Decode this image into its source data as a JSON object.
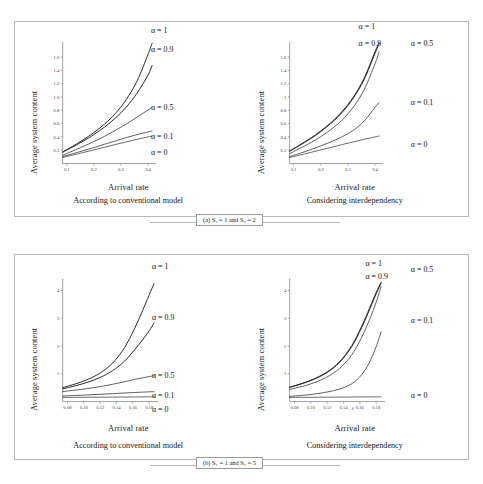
{
  "figure": {
    "panel_a_tag": "(a) S₁ = 1 and S₂ = 2",
    "panel_b_tag": "(b) S₁ = 1 and S₂ = 5",
    "axis_y_title": "Average system content",
    "axis_x_title": "Arrival rate",
    "caption_conventional": "According to conventional model",
    "caption_interdependency": "Considering interdependency",
    "lambda_symbol": "λ"
  },
  "chart_data": [
    {
      "id": "a-left",
      "type": "line",
      "title": "According to conventional model",
      "panel": "(a) S1 = 1 and S2 = 2",
      "xlabel": "Arrival rate",
      "ylabel": "Average system content",
      "xlim": [
        0.085,
        0.415
      ],
      "ylim": [
        0.0,
        1.8
      ],
      "xticks": [
        "0.1",
        "0.2",
        "0.3",
        "0.4"
      ],
      "xtickvals": [
        0.1,
        0.2,
        0.3,
        0.4
      ],
      "yticks": [
        "0.2",
        "0.4",
        "0.6",
        "0.8",
        "1.0",
        "1.2",
        "1.4",
        "1.6"
      ],
      "ytickvals": [
        0.2,
        0.4,
        0.6,
        0.8,
        1.0,
        1.2,
        1.4,
        1.6
      ],
      "grid": false,
      "legend_position": "right-inline",
      "x": [
        0.085,
        0.12,
        0.16,
        0.2,
        0.24,
        0.28,
        0.32,
        0.36,
        0.4,
        0.415
      ],
      "series": [
        {
          "name": "α = 1",
          "label": "α = 1",
          "values": [
            0.175,
            0.255,
            0.355,
            0.465,
            0.595,
            0.755,
            0.965,
            1.245,
            1.64,
            1.81
          ]
        },
        {
          "name": "α = 0.9",
          "label": "α = 0.9",
          "values": [
            0.17,
            0.245,
            0.335,
            0.435,
            0.55,
            0.685,
            0.85,
            1.06,
            1.33,
            1.475
          ]
        },
        {
          "name": "α = 0.5",
          "label": "α = 0.5",
          "values": [
            0.125,
            0.185,
            0.255,
            0.33,
            0.41,
            0.5,
            0.595,
            0.7,
            0.805,
            0.85
          ]
        },
        {
          "name": "α = 0.1",
          "label": "α = 0.1",
          "values": [
            0.105,
            0.145,
            0.192,
            0.24,
            0.29,
            0.34,
            0.39,
            0.435,
            0.475,
            0.49
          ]
        },
        {
          "name": "α = 0",
          "label": "α = 0",
          "values": [
            0.092,
            0.125,
            0.165,
            0.205,
            0.245,
            0.287,
            0.325,
            0.365,
            0.4,
            0.412
          ]
        }
      ]
    },
    {
      "id": "a-right",
      "type": "line",
      "title": "Considering interdependency",
      "panel": "(a) S1 = 1 and S2 = 2",
      "xlabel": "Arrival rate",
      "ylabel": "Average system content",
      "xlim": [
        0.085,
        0.415
      ],
      "ylim": [
        0.0,
        1.8
      ],
      "xticks": [
        "0.1",
        "0.2",
        "0.3",
        "0.4"
      ],
      "xtickvals": [
        0.1,
        0.2,
        0.3,
        0.4
      ],
      "yticks": [
        "0.2",
        "0.4",
        "0.6",
        "0.8",
        "1",
        "1.2",
        "1.4",
        "1.6"
      ],
      "ytickvals": [
        0.2,
        0.4,
        0.6,
        0.8,
        1.0,
        1.2,
        1.4,
        1.6
      ],
      "grid": false,
      "legend_position": "right-inline",
      "x": [
        0.085,
        0.12,
        0.16,
        0.2,
        0.24,
        0.28,
        0.32,
        0.36,
        0.4,
        0.415
      ],
      "series": [
        {
          "name": "α = 1",
          "label": "α = 1",
          "values": [
            0.19,
            0.275,
            0.375,
            0.49,
            0.625,
            0.79,
            1.0,
            1.285,
            1.68,
            1.82
          ]
        },
        {
          "name": "α = 0.9",
          "label": "α = 0.9",
          "values": [
            0.185,
            0.268,
            0.367,
            0.48,
            0.613,
            0.775,
            0.985,
            1.265,
            1.655,
            1.8
          ]
        },
        {
          "name": "α = 0.5",
          "label": "α = 0.5",
          "values": [
            0.15,
            0.222,
            0.308,
            0.405,
            0.52,
            0.66,
            0.85,
            1.11,
            1.5,
            1.68
          ]
        },
        {
          "name": "α = 0.1",
          "label": "α = 0.1",
          "values": [
            0.105,
            0.15,
            0.205,
            0.265,
            0.33,
            0.405,
            0.5,
            0.64,
            0.845,
            0.915
          ]
        },
        {
          "name": "α = 0",
          "label": "α = 0",
          "values": [
            0.092,
            0.125,
            0.165,
            0.205,
            0.245,
            0.287,
            0.325,
            0.365,
            0.4,
            0.412
          ]
        }
      ]
    },
    {
      "id": "b-left",
      "type": "line",
      "title": "According to conventional model",
      "panel": "(b) S1 = 1 and S2 = 5",
      "xlabel": "Arrival rate",
      "ylabel": "Average system content",
      "xlim": [
        0.074,
        0.186
      ],
      "ylim": [
        0.0,
        4.35
      ],
      "xticks": [
        "0.08",
        "0.10",
        "0.12",
        "0.14",
        "0.16",
        "0.18"
      ],
      "xtickvals": [
        0.08,
        0.1,
        0.12,
        0.14,
        0.16,
        0.18
      ],
      "yticks": [
        "1",
        "2",
        "3",
        "4"
      ],
      "ytickvals": [
        1,
        2,
        3,
        4
      ],
      "grid": false,
      "legend_position": "right-inline",
      "x": [
        0.074,
        0.09,
        0.105,
        0.12,
        0.135,
        0.15,
        0.162,
        0.172,
        0.18,
        0.186
      ],
      "series": [
        {
          "name": "α = 1",
          "label": "α = 1",
          "values": [
            0.5,
            0.64,
            0.8,
            1.03,
            1.38,
            1.95,
            2.62,
            3.28,
            3.84,
            4.25
          ]
        },
        {
          "name": "α = 0.9",
          "label": "α = 0.9",
          "values": [
            0.455,
            0.57,
            0.7,
            0.87,
            1.11,
            1.46,
            1.86,
            2.23,
            2.55,
            2.83
          ]
        },
        {
          "name": "α = 0.5",
          "label": "α = 0.5",
          "values": [
            0.36,
            0.415,
            0.47,
            0.54,
            0.62,
            0.715,
            0.795,
            0.855,
            0.9,
            0.93
          ]
        },
        {
          "name": "α = 0.1",
          "label": "α = 0.1",
          "values": [
            0.2,
            0.22,
            0.24,
            0.262,
            0.285,
            0.308,
            0.326,
            0.34,
            0.35,
            0.357
          ]
        },
        {
          "name": "α = 0",
          "label": "α = 0",
          "values": [
            0.15,
            0.152,
            0.155,
            0.158,
            0.161,
            0.164,
            0.166,
            0.168,
            0.17,
            0.171
          ]
        }
      ]
    },
    {
      "id": "b-right",
      "type": "line",
      "title": "Considering interdependency",
      "panel": "(b) S1 = 1 and S2 = 5",
      "xlabel": "Arrival rate",
      "ylabel": "Average system content",
      "xlim": [
        0.074,
        0.186
      ],
      "ylim": [
        0.0,
        4.35
      ],
      "xticks": [
        "0.08",
        "0.10",
        "0.12",
        "0.14",
        "0.16",
        "0.18"
      ],
      "xtickvals": [
        0.08,
        0.1,
        0.12,
        0.14,
        0.16,
        0.18
      ],
      "yticks": [
        "1",
        "2",
        "3",
        "4"
      ],
      "ytickvals": [
        1,
        2,
        3,
        4
      ],
      "grid": false,
      "legend_position": "right-inline",
      "x_axis_symbol": "λ",
      "x": [
        0.074,
        0.09,
        0.105,
        0.12,
        0.135,
        0.15,
        0.162,
        0.172,
        0.18,
        0.186
      ],
      "series": [
        {
          "name": "α = 1",
          "label": "α = 1",
          "values": [
            0.52,
            0.66,
            0.83,
            1.07,
            1.43,
            2.01,
            2.7,
            3.37,
            3.93,
            4.3
          ]
        },
        {
          "name": "α = 0.9",
          "label": "α = 0.9",
          "values": [
            0.515,
            0.65,
            0.818,
            1.05,
            1.405,
            1.975,
            2.655,
            3.32,
            3.88,
            4.26
          ]
        },
        {
          "name": "α = 0.5",
          "label": "α = 0.5",
          "values": [
            0.44,
            0.55,
            0.69,
            0.89,
            1.19,
            1.68,
            2.3,
            2.96,
            3.58,
            4.14
          ]
        },
        {
          "name": "α = 0.1",
          "label": "α = 0.1",
          "values": [
            0.185,
            0.225,
            0.275,
            0.345,
            0.45,
            0.64,
            0.96,
            1.42,
            1.98,
            2.51
          ]
        },
        {
          "name": "α = 0",
          "label": "α = 0",
          "values": [
            0.15,
            0.152,
            0.155,
            0.158,
            0.161,
            0.164,
            0.166,
            0.168,
            0.17,
            0.171
          ]
        }
      ]
    }
  ],
  "annotations": {
    "a_left": [
      {
        "label": "α = 1",
        "x": 0.6,
        "y": 0.055
      },
      {
        "label": "α = 0.9",
        "x": 0.6,
        "y": 0.155
      },
      {
        "label": "α = 0.5",
        "x": 0.6,
        "y": 0.455
      },
      {
        "label": "α = 0.1",
        "x": 0.6,
        "y": 0.605
      },
      {
        "label": "α = 0",
        "x": 0.6,
        "y": 0.685
      }
    ],
    "a_right": [
      {
        "label": "α = 1",
        "x": 0.515,
        "y": 0.035
      },
      {
        "label": "α = 0.9",
        "x": 0.515,
        "y": 0.125
      },
      {
        "label": "α = 0.5",
        "x": 0.745,
        "y": 0.125
      },
      {
        "label": "α = 0.1",
        "x": 0.745,
        "y": 0.43
      },
      {
        "label": "α = 0",
        "x": 0.745,
        "y": 0.645
      }
    ],
    "b_left": [
      {
        "label": "α = 1",
        "x": 0.605,
        "y": 0.07
      },
      {
        "label": "α = 0.9",
        "x": 0.605,
        "y": 0.32
      },
      {
        "label": "α = 0.5",
        "x": 0.605,
        "y": 0.605
      },
      {
        "label": "α = 0.1",
        "x": 0.605,
        "y": 0.7
      },
      {
        "label": "α = 0",
        "x": 0.605,
        "y": 0.772
      }
    ],
    "b_right": [
      {
        "label": "α = 1",
        "x": 0.545,
        "y": 0.055
      },
      {
        "label": "α = 0.9",
        "x": 0.545,
        "y": 0.12
      },
      {
        "label": "α = 0.5",
        "x": 0.745,
        "y": 0.085
      },
      {
        "label": "α = 0.1",
        "x": 0.745,
        "y": 0.335
      },
      {
        "label": "α = 0",
        "x": 0.745,
        "y": 0.7
      }
    ]
  }
}
